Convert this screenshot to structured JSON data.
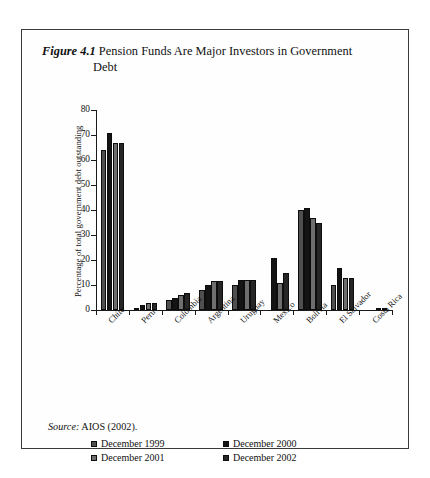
{
  "figure": {
    "number": "Figure 4.1",
    "title_line1": "Pension Funds Are Major Investors in Government",
    "title_line2": "Debt",
    "source_label": "Source:",
    "source_text": "AIOS (2002)."
  },
  "chart_data": {
    "type": "bar",
    "title": "Figure 4.1 Pension Funds Are Major Investors in Government Debt",
    "xlabel": "",
    "ylabel": "Percentage of total government debt outstanding",
    "ylim": [
      0,
      80
    ],
    "yticks": [
      0,
      10,
      20,
      30,
      40,
      50,
      60,
      70,
      80
    ],
    "grid": false,
    "legend_position": "bottom",
    "categories": [
      "Chile",
      "Peru",
      "Colombia",
      "Argentina",
      "Uruguay",
      "Mexico",
      "Bolivia",
      "El Salvador",
      "Costa Rica"
    ],
    "series": [
      {
        "name": "December 1999",
        "color": "#4f4f4f",
        "values": [
          64,
          1,
          4,
          8,
          10,
          0,
          40,
          10,
          0
        ]
      },
      {
        "name": "December 2000",
        "color": "#141414",
        "values": [
          71,
          2,
          5,
          10,
          12,
          21,
          41,
          17,
          0
        ]
      },
      {
        "name": "December 2001",
        "color": "#6e6e6e",
        "values": [
          67,
          3,
          6,
          11.5,
          12,
          11,
          37,
          13,
          0.5
        ]
      },
      {
        "name": "December 2002",
        "color": "#262626",
        "values": [
          67,
          3,
          7,
          11.5,
          12,
          15,
          35,
          13,
          0.8
        ]
      }
    ]
  }
}
